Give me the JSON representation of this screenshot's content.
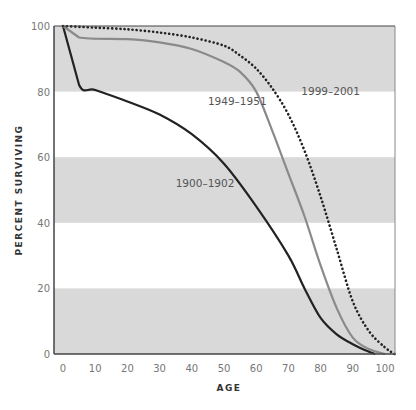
{
  "chart_data": {
    "type": "line",
    "title": "",
    "xlabel": "AGE",
    "ylabel": "PERCENT SURVIVING",
    "xlim": [
      0,
      103
    ],
    "ylim": [
      0,
      100
    ],
    "x_ticks": [
      0,
      10,
      20,
      30,
      40,
      50,
      60,
      70,
      80,
      90,
      100
    ],
    "y_ticks": [
      0,
      20,
      40,
      60,
      80,
      100
    ],
    "grid": "alternating horizontal bands (gray 0-20, 40-60, 80-100)",
    "legend": "inline labels",
    "series": [
      {
        "name": "1900-1902",
        "style": "solid",
        "color": "#222222",
        "x": [
          0,
          5,
          10,
          20,
          30,
          40,
          50,
          60,
          70,
          75,
          80,
          85,
          90,
          95,
          97
        ],
        "values": [
          100,
          82,
          80.5,
          77,
          73,
          67,
          58,
          45,
          30,
          20,
          11,
          6,
          3,
          0.7,
          0
        ]
      },
      {
        "name": "1949-1951",
        "style": "solid",
        "color": "#8a8a8a",
        "x": [
          0,
          5,
          20,
          30,
          40,
          50,
          55,
          60,
          65,
          70,
          75,
          80,
          85,
          90,
          95,
          100
        ],
        "values": [
          100,
          96.5,
          96,
          95,
          93,
          89,
          86,
          80,
          68,
          55,
          42,
          27,
          14,
          5,
          1.5,
          0
        ]
      },
      {
        "name": "1999-2001",
        "style": "dotted",
        "color": "#222222",
        "x": [
          0,
          10,
          20,
          30,
          40,
          50,
          55,
          60,
          65,
          70,
          75,
          80,
          85,
          90,
          95,
          100,
          103
        ],
        "values": [
          100,
          99.5,
          99,
          98,
          96.5,
          94,
          91,
          87,
          81,
          73,
          62,
          48,
          32,
          16,
          7,
          2,
          0
        ]
      }
    ],
    "annotations": [
      {
        "text": "1999-2001",
        "x": 74,
        "y": 79
      },
      {
        "text": "1949-1951",
        "x": 45,
        "y": 76
      },
      {
        "text": "1900-1902",
        "x": 35,
        "y": 51
      }
    ]
  },
  "colors": {
    "band": "#d9d9d9",
    "axis": "#444444"
  }
}
